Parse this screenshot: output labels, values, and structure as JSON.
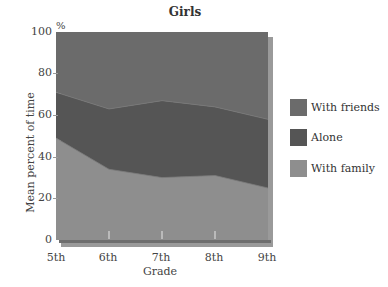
{
  "chart_data": {
    "type": "area",
    "stacked": true,
    "title": "Girls",
    "xlabel": "Grade",
    "ylabel": "Mean percent of time",
    "y_unit": "%",
    "categories": [
      "5th",
      "6th",
      "7th",
      "8th",
      "9th"
    ],
    "ylim": [
      0,
      100
    ],
    "yticks": [
      0,
      20,
      40,
      60,
      80,
      100
    ],
    "series": [
      {
        "name": "With family",
        "values": [
          49,
          34,
          30,
          31,
          25
        ],
        "color": "#8e8e8e"
      },
      {
        "name": "Alone",
        "values": [
          22,
          29,
          37,
          33,
          33
        ],
        "color": "#555555"
      },
      {
        "name": "With friends",
        "values": [
          29,
          37,
          33,
          36,
          42
        ],
        "color": "#6b6b6b"
      }
    ],
    "legend": [
      "With friends",
      "Alone",
      "With family"
    ],
    "legend_position": "right",
    "grid": false
  },
  "labels": {
    "title": "Girls",
    "pct": "%",
    "xlabel": "Grade",
    "ylabel": "Mean percent of time",
    "yticks": [
      "100",
      "80",
      "60",
      "40",
      "20",
      "0"
    ],
    "xticks": [
      "5th",
      "6th",
      "7th",
      "8th",
      "9th"
    ],
    "legend": [
      {
        "label": "With friends",
        "color": "#6b6b6b"
      },
      {
        "label": "Alone",
        "color": "#555555"
      },
      {
        "label": "With family",
        "color": "#8e8e8e"
      }
    ]
  }
}
